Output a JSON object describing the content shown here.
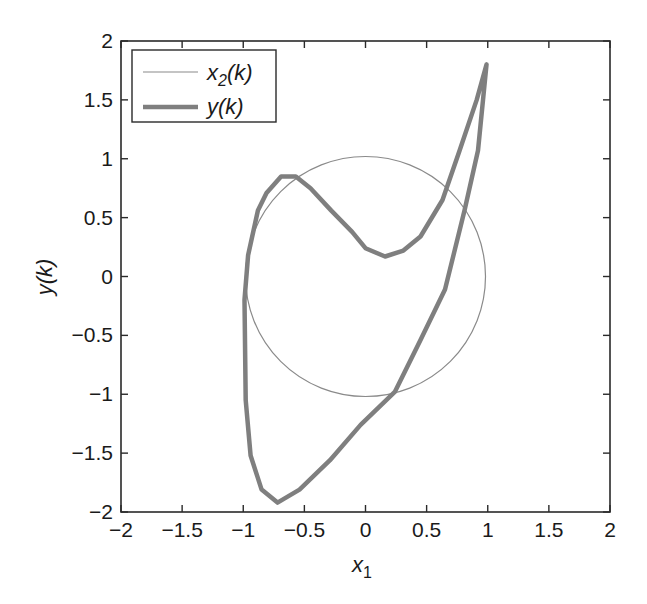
{
  "chart_data": {
    "type": "line",
    "title": "",
    "xlabel": "x",
    "xlabel_sub": "1",
    "ylabel": "y(k)",
    "xlim": [
      -2,
      2
    ],
    "ylim": [
      -2,
      2
    ],
    "grid": false,
    "legend_position": "upper left",
    "xticks": [
      -2,
      -1.5,
      -1,
      -0.5,
      0,
      0.5,
      1,
      1.5,
      2
    ],
    "yticks": [
      -2,
      -1.5,
      -1,
      -0.5,
      0,
      0.5,
      1,
      1.5,
      2
    ],
    "xtick_labels": [
      "−2",
      "−1.5",
      "−1",
      "−0.5",
      "0",
      "0.5",
      "1",
      "1.5",
      "2"
    ],
    "ytick_labels": [
      "−2",
      "−1.5",
      "−1",
      "−0.5",
      "0",
      "0.5",
      "1",
      "1.5",
      "2"
    ],
    "series": [
      {
        "name": "x2(k)",
        "legend_main": "x",
        "legend_sub": "2",
        "legend_rest": "(k)",
        "style": "thin",
        "color": "#8a8a8a",
        "shape": "circle",
        "center": [
          0,
          0
        ],
        "radius": 1
      },
      {
        "name": "y(k)",
        "legend_main": "y(k)",
        "style": "thick",
        "color": "#7f7f7f",
        "x": [
          0.99,
          0.92,
          0.81,
          0.65,
          0.45,
          0.24,
          -0.04,
          -0.29,
          -0.54,
          -0.72,
          -0.85,
          -0.94,
          -0.98,
          -0.99,
          -0.96,
          -0.88,
          -0.81,
          -0.69,
          -0.57,
          -0.45,
          -0.28,
          -0.11,
          0.0,
          0.16,
          0.31,
          0.45,
          0.63,
          0.77,
          0.91,
          0.99
        ],
        "y": [
          1.8,
          1.07,
          0.56,
          -0.11,
          -0.54,
          -0.98,
          -1.26,
          -1.56,
          -1.81,
          -1.92,
          -1.81,
          -1.52,
          -1.05,
          -0.2,
          0.18,
          0.56,
          0.71,
          0.85,
          0.85,
          0.75,
          0.56,
          0.38,
          0.24,
          0.17,
          0.22,
          0.34,
          0.65,
          1.07,
          1.5,
          1.8
        ]
      }
    ]
  },
  "colors": {
    "axes": "#2a2a2a",
    "circle": "#8a8a8a",
    "y_curve": "#7f7f7f"
  }
}
